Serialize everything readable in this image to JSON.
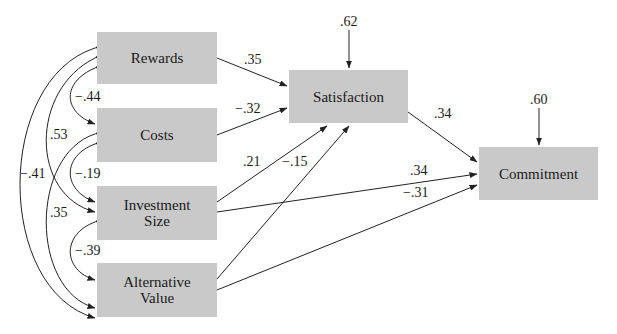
{
  "diagram": {
    "type": "path-model",
    "nodes": {
      "rewards": {
        "label": "Rewards"
      },
      "costs": {
        "label": "Costs"
      },
      "investment_size": {
        "label_line1": "Investment",
        "label_line2": "Size"
      },
      "alternative_value": {
        "label_line1": "Alternative",
        "label_line2": "Value"
      },
      "satisfaction": {
        "label": "Satisfaction"
      },
      "commitment": {
        "label": "Commitment"
      }
    },
    "error_terms": {
      "satisfaction": ".62",
      "commitment": ".60"
    },
    "paths": {
      "rewards_to_satisfaction": ".35",
      "costs_to_satisfaction": "−.32",
      "investment_to_satisfaction": ".21",
      "alternative_to_satisfaction": "−.15",
      "satisfaction_to_commitment": ".34",
      "investment_to_commitment": ".34",
      "alternative_to_commitment": "−.31"
    },
    "correlations": {
      "rewards_costs": "−.44",
      "rewards_investment": ".53",
      "rewards_alternative": "−.41",
      "costs_investment": "−.19",
      "costs_alternative": ".35",
      "investment_alternative": "−.39"
    },
    "colors": {
      "box_fill": "#c9c9c9",
      "line": "#222222",
      "text": "#1a1a1a"
    }
  }
}
